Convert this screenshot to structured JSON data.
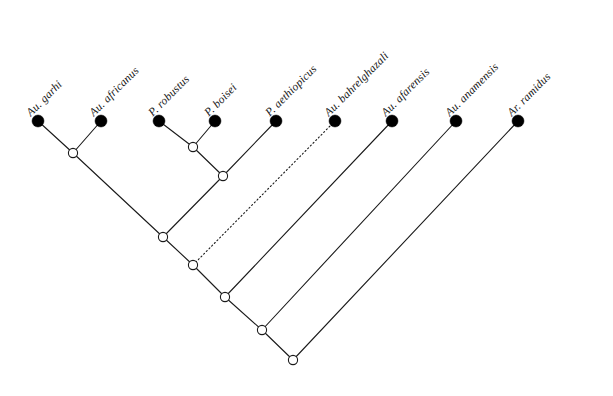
{
  "figure": {
    "kind": "cladogram",
    "background_color": "#ffffff",
    "line_color": "#1a1a1a",
    "tip_fill_color": "#000000",
    "internal_fill_color": "#ffffff"
  },
  "taxa": [
    {
      "id": "au-garhi",
      "label": "Au. garhi",
      "tip_x": 38,
      "tip_y": 121,
      "label_x": 28,
      "label_y": 108,
      "angle": -45
    },
    {
      "id": "au-africanus",
      "label": "Au. africanus",
      "tip_x": 101,
      "tip_y": 121,
      "label_x": 91,
      "label_y": 108,
      "angle": -45
    },
    {
      "id": "p-robustus",
      "label": "P. robustus",
      "tip_x": 159,
      "tip_y": 121,
      "label_x": 150,
      "label_y": 108,
      "angle": -45
    },
    {
      "id": "p-boisei",
      "label": "P. boisei",
      "tip_x": 215,
      "tip_y": 121,
      "label_x": 206,
      "label_y": 108,
      "angle": -45
    },
    {
      "id": "p-aethiopicus",
      "label": "P. aethiopicus",
      "tip_x": 276,
      "tip_y": 121,
      "label_x": 267,
      "label_y": 108,
      "angle": -45
    },
    {
      "id": "au-bahrelghazali",
      "label": "Au. bahrelghazali",
      "tip_x": 335,
      "tip_y": 121,
      "label_x": 326,
      "label_y": 108,
      "angle": -45
    },
    {
      "id": "au-afarensis",
      "label": "Au. afarensis",
      "tip_x": 392,
      "tip_y": 121,
      "label_x": 383,
      "label_y": 108,
      "angle": -45
    },
    {
      "id": "au-anamensis",
      "label": "Au. anamensis",
      "tip_x": 456,
      "tip_y": 121,
      "label_x": 447,
      "label_y": 108,
      "angle": -45
    },
    {
      "id": "ar-ramidus",
      "label": "Ar. ramidus",
      "tip_x": 518,
      "tip_y": 121,
      "label_x": 509,
      "label_y": 108,
      "angle": -45
    }
  ],
  "internal_nodes": [
    {
      "id": "node-garhi-africanus",
      "x": 73,
      "y": 153
    },
    {
      "id": "node-robustus-boisei",
      "x": 193,
      "y": 147
    },
    {
      "id": "node-paranthropus",
      "x": 223,
      "y": 176
    },
    {
      "id": "node-australopith",
      "x": 163,
      "y": 237
    },
    {
      "id": "node-aethiopicus-join",
      "x": 193,
      "y": 265
    },
    {
      "id": "node-bahrelghazali-join",
      "x": 225,
      "y": 297
    },
    {
      "id": "node-anamensis-join",
      "x": 262,
      "y": 330
    },
    {
      "id": "node-root",
      "x": 293,
      "y": 360
    }
  ],
  "branches": [
    {
      "id": "branch-au-garhi",
      "x1": 73,
      "y1": 153,
      "x2": 38,
      "y2": 121,
      "style": "solid"
    },
    {
      "id": "branch-au-africanus",
      "x1": 73,
      "y1": 153,
      "x2": 101,
      "y2": 121,
      "style": "solid"
    },
    {
      "id": "branch-p-robustus",
      "x1": 193,
      "y1": 147,
      "x2": 159,
      "y2": 121,
      "style": "solid"
    },
    {
      "id": "branch-p-boisei",
      "x1": 193,
      "y1": 147,
      "x2": 215,
      "y2": 121,
      "style": "solid"
    },
    {
      "id": "branch-paranthropus-up",
      "x1": 223,
      "y1": 176,
      "x2": 193,
      "y2": 147,
      "style": "solid"
    },
    {
      "id": "branch-p-aethiopicus-tip",
      "x1": 223,
      "y1": 176,
      "x2": 276,
      "y2": 121,
      "style": "solid"
    },
    {
      "id": "branch-australopith-left",
      "x1": 163,
      "y1": 237,
      "x2": 73,
      "y2": 153,
      "style": "solid"
    },
    {
      "id": "branch-australopith-right",
      "x1": 163,
      "y1": 237,
      "x2": 223,
      "y2": 176,
      "style": "solid"
    },
    {
      "id": "branch-aethiopicus-dotted",
      "x1": 193,
      "y1": 265,
      "x2": 335,
      "y2": 121,
      "style": "dotted"
    },
    {
      "id": "branch-join1-left",
      "x1": 193,
      "y1": 265,
      "x2": 163,
      "y2": 237,
      "style": "solid"
    },
    {
      "id": "branch-join2-left",
      "x1": 225,
      "y1": 297,
      "x2": 193,
      "y2": 265,
      "style": "solid"
    },
    {
      "id": "branch-au-afarensis",
      "x1": 225,
      "y1": 297,
      "x2": 392,
      "y2": 121,
      "style": "solid"
    },
    {
      "id": "branch-join3-left",
      "x1": 262,
      "y1": 330,
      "x2": 225,
      "y2": 297,
      "style": "solid"
    },
    {
      "id": "branch-au-anamensis",
      "x1": 262,
      "y1": 330,
      "x2": 456,
      "y2": 121,
      "style": "solid"
    },
    {
      "id": "branch-root-left",
      "x1": 293,
      "y1": 360,
      "x2": 262,
      "y2": 330,
      "style": "solid"
    },
    {
      "id": "branch-ar-ramidus",
      "x1": 293,
      "y1": 360,
      "x2": 518,
      "y2": 121,
      "style": "solid"
    }
  ],
  "geometry": {
    "tip_radius": 6,
    "internal_radius": 4.6
  }
}
